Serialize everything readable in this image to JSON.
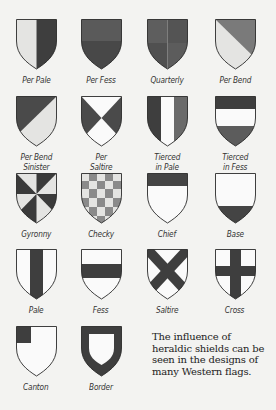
{
  "colors": {
    "background": "#f3f3f1",
    "dark": "#4a4a4a",
    "medium": "#7a7a7a",
    "light": "#e4e4e2",
    "white": "#fafafa",
    "outline": "#2a2a2a"
  },
  "shields": [
    {
      "id": "per-pale",
      "label_lines": [
        "Per Pale"
      ]
    },
    {
      "id": "per-fess",
      "label_lines": [
        "Per Fess"
      ]
    },
    {
      "id": "quarterly",
      "label_lines": [
        "Quarterly"
      ]
    },
    {
      "id": "per-bend",
      "label_lines": [
        "Per Bend"
      ]
    },
    {
      "id": "per-bend-sinister",
      "label_lines": [
        "Per Bend",
        "Sinister"
      ]
    },
    {
      "id": "per-saltire",
      "label_lines": [
        "Per",
        "Saltire"
      ]
    },
    {
      "id": "tierced-in-pale",
      "label_lines": [
        "Tierced",
        "in Pale"
      ]
    },
    {
      "id": "tierced-in-fess",
      "label_lines": [
        "Tierced",
        "in Fess"
      ]
    },
    {
      "id": "gyronny",
      "label_lines": [
        "Gyronny"
      ]
    },
    {
      "id": "checky",
      "label_lines": [
        "Checky"
      ]
    },
    {
      "id": "chief",
      "label_lines": [
        "Chief"
      ]
    },
    {
      "id": "base",
      "label_lines": [
        "Base"
      ]
    },
    {
      "id": "pale",
      "label_lines": [
        "Pale"
      ]
    },
    {
      "id": "fess",
      "label_lines": [
        "Fess"
      ]
    },
    {
      "id": "saltire",
      "label_lines": [
        "Saltire"
      ]
    },
    {
      "id": "cross",
      "label_lines": [
        "Cross"
      ]
    },
    {
      "id": "canton",
      "label_lines": [
        "Canton"
      ]
    },
    {
      "id": "border",
      "label_lines": [
        "Border"
      ]
    }
  ],
  "note": {
    "lines": [
      "The influence of",
      "heraldic shields can be",
      "seen in the designs of",
      "many Western flags."
    ]
  }
}
